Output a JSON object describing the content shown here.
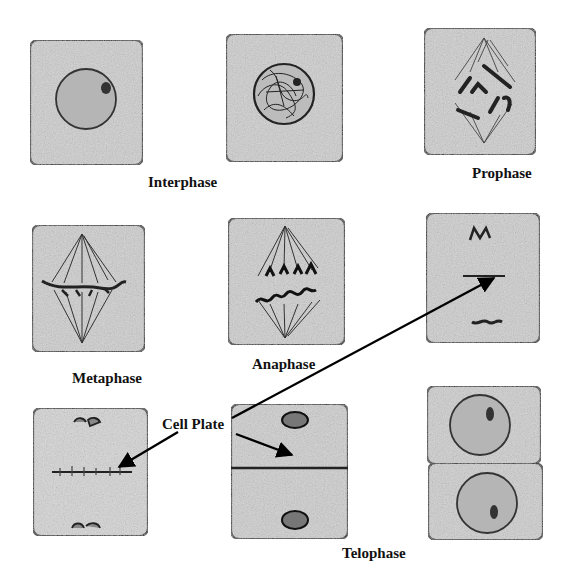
{
  "diagram": {
    "labels": {
      "interphase": "Interphase",
      "prophase": "Prophase",
      "metaphase": "Metaphase",
      "anaphase": "Anaphase",
      "cell_plate": "Cell Plate",
      "telophase": "Telophase"
    },
    "cells": [
      {
        "id": "interphase-cell",
        "stage": "Interphase",
        "feature": "nucleus with nucleolus"
      },
      {
        "id": "early-prophase-cell",
        "stage": "Interphase/Prophase",
        "feature": "condensing chromatin in nucleus"
      },
      {
        "id": "prophase-cell",
        "stage": "Prophase",
        "feature": "chromosomes with spindle fibers"
      },
      {
        "id": "metaphase-cell",
        "stage": "Metaphase",
        "feature": "chromosomes aligned at equator"
      },
      {
        "id": "anaphase-cell",
        "stage": "Anaphase",
        "feature": "chromatids pulled to poles"
      },
      {
        "id": "early-telophase-cell",
        "stage": "Telophase",
        "feature": "cell plate forming"
      },
      {
        "id": "telophase-cell-plate-cell",
        "stage": "Telophase",
        "feature": "cell plate with vesicles"
      },
      {
        "id": "telophase-dividing-cell",
        "stage": "Telophase",
        "feature": "cell wall dividing two cells"
      },
      {
        "id": "daughter-cells",
        "stage": "Telophase/Cytokinesis",
        "feature": "two daughter cells with nuclei"
      }
    ],
    "colors": {
      "cell_fill": "#c9c9c9",
      "outline": "#222222",
      "background": "#ffffff",
      "arrow": "#000000"
    }
  }
}
